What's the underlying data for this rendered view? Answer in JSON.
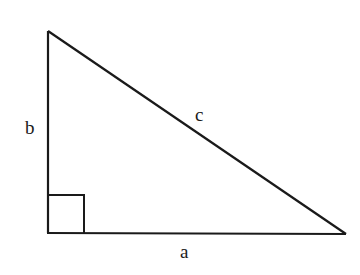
{
  "diagram": {
    "labels": {
      "a": "a",
      "b": "b",
      "c": "c"
    },
    "vertices": {
      "top": [
        48,
        31
      ],
      "right_angle": [
        48,
        233
      ],
      "right": [
        346,
        234
      ]
    },
    "right_angle_marker_size": 36,
    "stroke_color": "#1a1a1a"
  }
}
